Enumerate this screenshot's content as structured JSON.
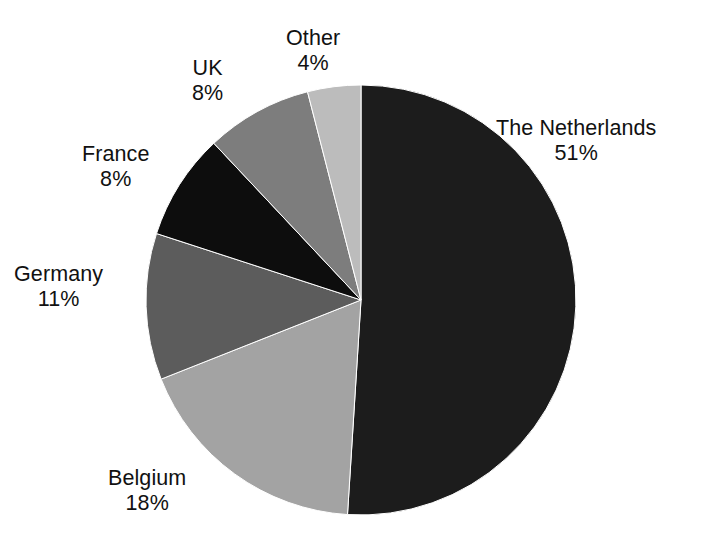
{
  "chart_data": {
    "type": "pie",
    "title": "",
    "subtitle": "",
    "xlabel": "",
    "ylabel": "",
    "legend_position": "none",
    "grid": false,
    "labels_show_percent": true,
    "start_angle_deg": 0,
    "direction": "clockwise",
    "categories": [
      "The Netherlands",
      "Belgium",
      "Germany",
      "France",
      "UK",
      "Other"
    ],
    "values": [
      51,
      18,
      11,
      8,
      8,
      4
    ],
    "unit": "%",
    "slices": [
      {
        "label": "The Netherlands",
        "value": 51,
        "value_text": "51%",
        "color": "#1c1c1c"
      },
      {
        "label": "Belgium",
        "value": 18,
        "value_text": "18%",
        "color": "#a3a3a3"
      },
      {
        "label": "Germany",
        "value": 11,
        "value_text": "11%",
        "color": "#5c5c5c"
      },
      {
        "label": "France",
        "value": 8,
        "value_text": "8%",
        "color": "#0d0d0d"
      },
      {
        "label": "UK",
        "value": 8,
        "value_text": "8%",
        "color": "#7d7d7d"
      },
      {
        "label": "Other",
        "value": 4,
        "value_text": "4%",
        "color": "#bcbcbc"
      }
    ],
    "geometry": {
      "center_x": 361,
      "center_y": 300,
      "radius": 215
    },
    "colors": {
      "background": "#ffffff",
      "text": "#111111",
      "outline": "#ffffff"
    }
  }
}
